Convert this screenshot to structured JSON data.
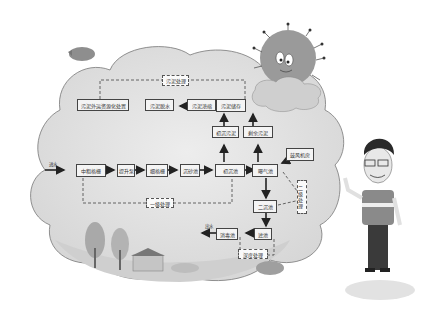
{
  "diagram": {
    "nodes": {
      "sludge_resource": "污泥外运资源化处置",
      "sludge_dewater": "污泥脱水",
      "sludge_thicken": "污泥浓缩",
      "sludge_storage": "污泥储存",
      "sludge_treat": "污泥处理",
      "primary_sludge": "初沉污泥",
      "excess_sludge": "剩余污泥",
      "inlet_label": "进水",
      "coarse_screen": "中粗格栅",
      "pump": "提升泵",
      "fine_screen": "细格栅",
      "grit": "沉砂池",
      "primary_clarifier": "初沉池",
      "aeration": "曝气池",
      "blower": "鼓风机房",
      "secondary_clarifier": "二沉池",
      "filter": "滤池",
      "disinfection": "消毒池",
      "outlet_label": "出水",
      "primary_process": "一级处理",
      "secondary_process": "二级处理",
      "deep_process": "深度处理"
    }
  }
}
